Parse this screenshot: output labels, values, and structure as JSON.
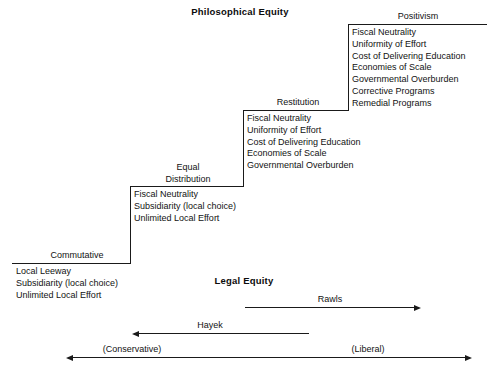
{
  "figure": {
    "philosophical_equity_title": "Philosophical Equity",
    "legal_equity_title": "Legal Equity"
  },
  "tiers": [
    {
      "id": "commutative",
      "label": "Commutative",
      "label_line2": "",
      "items": [
        "Local Leeway",
        "Subsidiarity (local choice)",
        "Unlimited Local Effort"
      ]
    },
    {
      "id": "equal-distribution",
      "label": "Equal",
      "label_line2": "Distribution",
      "items": [
        "Fiscal Neutrality",
        "Subsidiarity (local choice)",
        "Unlimited Local Effort"
      ]
    },
    {
      "id": "restitution",
      "label": "Restitution",
      "label_line2": "",
      "items": [
        "Fiscal Neutrality",
        "Uniformity of Effort",
        "Cost of Delivering Education",
        "Economies of Scale",
        "Governmental Overburden"
      ]
    },
    {
      "id": "positivism",
      "label": "Positivism",
      "label_line2": "",
      "items": [
        "Fiscal Neutrality",
        "Uniformity of Effort",
        "Cost of Delivering Education",
        "Economies of Scale",
        "Governmental Overburden",
        "Corrective Programs",
        "Remedial Programs"
      ]
    }
  ],
  "spectrum": {
    "rawls_label": "Rawls",
    "hayek_label": "Hayek",
    "conservative_label": "(Conservative)",
    "liberal_label": "(Liberal)"
  },
  "colors": {
    "line": "#1a1a1a",
    "text": "#121212",
    "background": "#ffffff"
  }
}
